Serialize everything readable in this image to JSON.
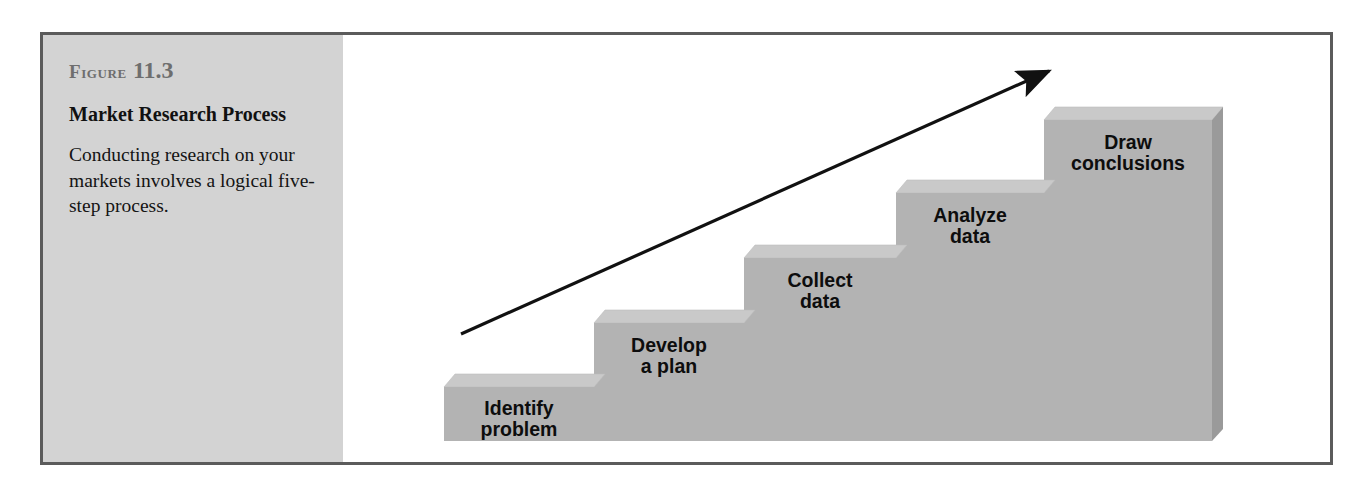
{
  "figure": {
    "number_word": "Figure",
    "number_value": "11.3",
    "title": "Market Research Process",
    "description": "Conducting research on your markets involves a logical five-step process."
  },
  "diagram": {
    "type": "staircase-process",
    "arrow_label": "upward-progress-arrow",
    "steps": [
      {
        "index": 1,
        "line1": "Identify",
        "line2": "problem"
      },
      {
        "index": 2,
        "line1": "Develop",
        "line2": "a plan"
      },
      {
        "index": 3,
        "line1": "Collect",
        "line2": "data"
      },
      {
        "index": 4,
        "line1": "Analyze",
        "line2": "data"
      },
      {
        "index": 5,
        "line1": "Draw",
        "line2": "conclusions"
      }
    ]
  },
  "colors": {
    "frame_border": "#5b5b5b",
    "caption_background": "#d3d3d3",
    "figure_number_text": "#6e6e6e",
    "step_front_face": "#b3b3b3",
    "step_top_face": "#c9c9c9",
    "step_side_face": "#9a9a9a",
    "arrow": "#111111",
    "label_text": "#0d0d0d"
  }
}
